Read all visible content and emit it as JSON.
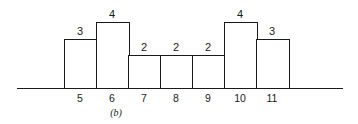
{
  "chart_data": {
    "type": "bar",
    "title": "",
    "caption": "(b)",
    "xlabel": "",
    "ylabel": "",
    "categories": [
      "5",
      "6",
      "7",
      "8",
      "9",
      "10",
      "11"
    ],
    "values": [
      3,
      4,
      2,
      2,
      2,
      4,
      3
    ],
    "data_labels": [
      "3",
      "4",
      "2",
      "2",
      "2",
      "4",
      "3"
    ],
    "grid": false,
    "legend": null,
    "axes": {
      "y_axis_visible": false,
      "x_baseline_visible": true
    },
    "ylim": [
      0,
      4
    ]
  },
  "layout": {
    "bar_left_start": 64,
    "bar_width": 32,
    "baseline_y": 88,
    "unit_height": 16.5
  }
}
